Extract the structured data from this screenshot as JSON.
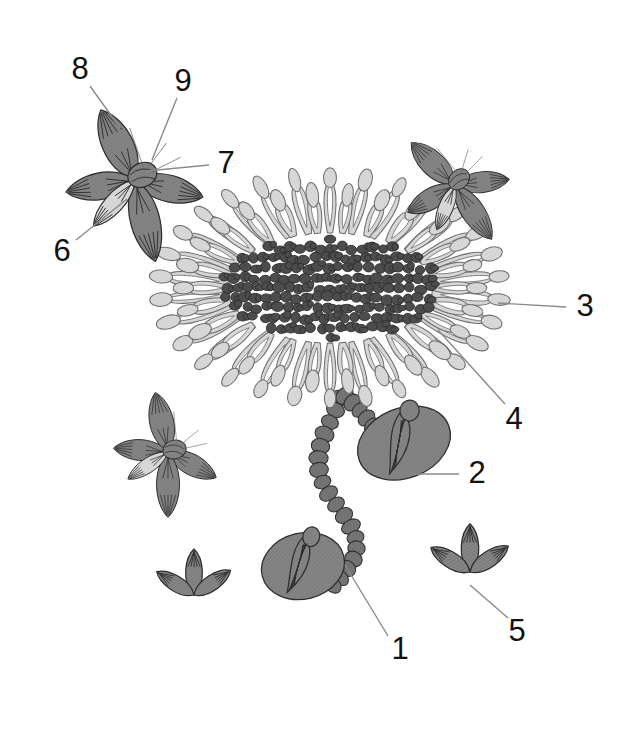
{
  "figure": {
    "type": "botanical-line-diagram",
    "width": 622,
    "height": 733,
    "background_color": "#ffffff"
  },
  "colors": {
    "background": "#ffffff",
    "ray_floret_fill": "#d9d9d9",
    "ray_floret_stroke": "#6e6e6e",
    "disc_floret_fill": "#4d4d4d",
    "disc_floret_stroke": "#2b2b2b",
    "bract_fill": "#7f7f7f",
    "bract_stroke": "#2e2e2e",
    "stem_fill": "#6f6f6f",
    "stem_stroke": "#2e2e2e",
    "detail_petal_fill": "#808080",
    "detail_petal_stroke": "#2b2b2b",
    "leader_line": "#8a8a8a",
    "label_text": "#111111"
  },
  "labels": [
    {
      "id": "1",
      "text": "1",
      "x": 400,
      "y": 651,
      "leader": {
        "x1": 388,
        "y1": 636,
        "x2": 345,
        "y2": 565
      }
    },
    {
      "id": "2",
      "text": "2",
      "x": 477,
      "y": 475,
      "leader": {
        "x1": 459,
        "y1": 474,
        "x2": 410,
        "y2": 474
      }
    },
    {
      "id": "3",
      "text": "3",
      "x": 585,
      "y": 308,
      "leader": {
        "x1": 566,
        "y1": 307,
        "x2": 498,
        "y2": 303
      }
    },
    {
      "id": "4",
      "text": "4",
      "x": 514,
      "y": 421,
      "leader": {
        "x1": 505,
        "y1": 404,
        "x2": 438,
        "y2": 330
      }
    },
    {
      "id": "5",
      "text": "5",
      "x": 517,
      "y": 633,
      "leader": {
        "x1": 508,
        "y1": 618,
        "x2": 470,
        "y2": 585
      }
    },
    {
      "id": "6",
      "text": "6",
      "x": 62,
      "y": 253,
      "leader": {
        "x1": 76,
        "y1": 240,
        "x2": 127,
        "y2": 199
      }
    },
    {
      "id": "7",
      "text": "7",
      "x": 226,
      "y": 165,
      "leader": {
        "x1": 209,
        "y1": 165,
        "x2": 147,
        "y2": 171
      }
    },
    {
      "id": "8",
      "text": "8",
      "x": 80,
      "y": 71,
      "leader": {
        "x1": 90,
        "y1": 86,
        "x2": 120,
        "y2": 128
      }
    },
    {
      "id": "9",
      "text": "9",
      "x": 183,
      "y": 83,
      "leader": {
        "x1": 177,
        "y1": 98,
        "x2": 152,
        "y2": 160
      }
    }
  ],
  "parts": [
    {
      "label_id": "1",
      "name": "stem",
      "description": "Segmented beaded stem"
    },
    {
      "label_id": "2",
      "name": "bract-leaf",
      "description": "Involucral bract / leaf"
    },
    {
      "label_id": "3",
      "name": "ray-floret",
      "description": "Outer ray floret loop"
    },
    {
      "label_id": "4",
      "name": "ray-floret-inner",
      "description": "Inner ray floret"
    },
    {
      "label_id": "5",
      "name": "three-lobed-floret",
      "description": "Three lobed detached floret"
    },
    {
      "label_id": "6",
      "name": "petal-lobe",
      "description": "Petal lobe of detail floret"
    },
    {
      "label_id": "7",
      "name": "ovary",
      "description": "Ovary / receptacle of detail floret"
    },
    {
      "label_id": "8",
      "name": "upper-petal",
      "description": "Upper petal of detail floret"
    },
    {
      "label_id": "9",
      "name": "style-branch",
      "description": "Style branch / stamen"
    }
  ],
  "details": {
    "flower_head": {
      "name": "main-flower-head",
      "center_x": 330,
      "center_y": 288,
      "ray_count": 30,
      "disc_blob_count": 230
    },
    "detail_florets": [
      {
        "name": "detail-floret-top-left",
        "cx": 135,
        "cy": 180,
        "rotation": -8,
        "scale": 1.0
      },
      {
        "name": "detail-floret-top-right",
        "cx": 455,
        "cy": 185,
        "rotation": -28,
        "scale": 0.78
      },
      {
        "name": "detail-floret-mid-left",
        "cx": 168,
        "cy": 452,
        "rotation": 6,
        "scale": 0.78
      }
    ],
    "three_lobed": [
      {
        "name": "three-lobed-left",
        "cx": 194,
        "cy": 595,
        "scale": 1.0
      },
      {
        "name": "three-lobed-right",
        "cx": 470,
        "cy": 572,
        "scale": 1.05
      }
    ],
    "bracts": [
      {
        "name": "bract-upper",
        "cx": 404,
        "cy": 443,
        "rx": 48,
        "ry": 35,
        "rotation": -22
      },
      {
        "name": "bract-lower",
        "cx": 303,
        "cy": 566,
        "rx": 42,
        "ry": 33,
        "rotation": -14
      }
    ]
  }
}
